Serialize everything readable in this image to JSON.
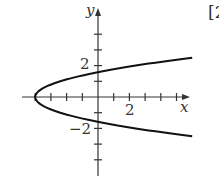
{
  "corner_mark": "[2",
  "chart_data": {
    "type": "line",
    "title": "",
    "xlabel": "x",
    "ylabel": "y",
    "x_tick_label": "2",
    "y_tick_labels": [
      "2",
      "−2"
    ],
    "xlim": [
      -4.8,
      5.6
    ],
    "ylim": [
      -4.9,
      5.5
    ],
    "grid": false,
    "legend": null,
    "series": [
      {
        "name": "parabola opening right, vertex (-4, 0)",
        "equation": "x = 1.6*y^2 - 4",
        "points": [
          [
            6,
            2.5
          ],
          [
            2.4,
            2
          ],
          [
            0,
            1.58
          ],
          [
            -2.4,
            1
          ],
          [
            -4,
            0
          ],
          [
            -2.4,
            -1
          ],
          [
            0,
            -1.58
          ],
          [
            2.4,
            -2
          ],
          [
            6,
            -2.5
          ]
        ]
      }
    ]
  },
  "colors": {
    "curve": "#111111",
    "axis": "#333333",
    "text": "#333333"
  }
}
